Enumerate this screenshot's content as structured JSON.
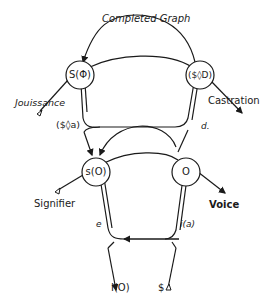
{
  "title": "Completed Graph",
  "colors": {
    "line": "#1a1a1a",
    "background": "#ffffff"
  },
  "nodes": {
    "s_barred_phi": "S(Φ)",
    "drive": "($◊D)",
    "s_o": "s(O)",
    "o": "O"
  },
  "labels": {
    "jouissance": "Jouissance",
    "castration": "Castration",
    "fantasy": "($◊a)",
    "desire": "d.",
    "signifier": "Signifier",
    "voice": "Voice",
    "ego": "e",
    "image": "i(a)",
    "ego_ideal": "I(O)",
    "subject": "$"
  }
}
